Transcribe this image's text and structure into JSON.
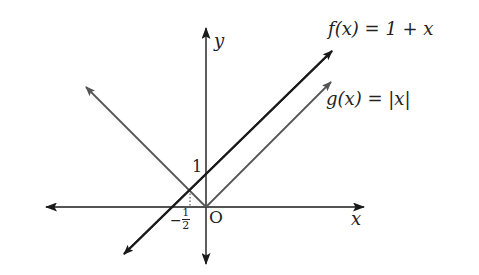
{
  "diagram": {
    "title": "",
    "axes": {
      "x_label": "x",
      "y_label": "y",
      "origin_label": "O"
    },
    "ticks": {
      "y_one": "1",
      "x_neg_half_sign": "−",
      "x_neg_half_num": "1",
      "x_neg_half_den": "2"
    },
    "functions": [
      {
        "id": "f",
        "label": "f(x) = 1 + x",
        "color": "#1a1a1a"
      },
      {
        "id": "g",
        "label": "g(x) = |x|",
        "color": "#555555"
      }
    ],
    "intersection": {
      "x": -0.5,
      "y": 0.5
    }
  }
}
